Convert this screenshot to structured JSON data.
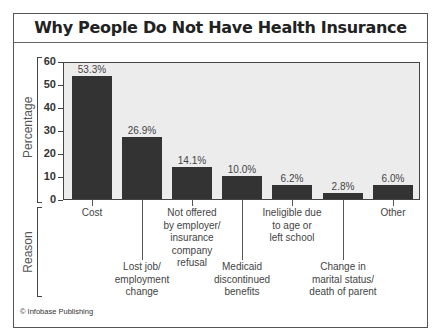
{
  "title": "Why People Do Not Have Health Insurance",
  "copyright": "© Infobase Publishing",
  "y_axis_label": "Percentage",
  "x_axis_label": "Reason",
  "colors": {
    "bar": "#333333",
    "plot_bg": "#ececec",
    "frame": "#555555"
  },
  "chart_data": {
    "type": "bar",
    "title": "Why People Do Not Have Health Insurance",
    "xlabel": "Reason",
    "ylabel": "Percentage",
    "ylim": [
      0,
      60
    ],
    "yticks": [
      0,
      10,
      20,
      30,
      40,
      50,
      60
    ],
    "grid": false,
    "legend": null,
    "categories": [
      "Cost",
      "Lost job/ employment change",
      "Not offered by employer/ insurance company refusal",
      "Medicaid discontinued benefits",
      "Ineligible due to age or left school",
      "Change in marital status/ death of parent",
      "Other"
    ],
    "values": [
      53.3,
      26.9,
      14.1,
      10.0,
      6.2,
      2.8,
      6.0
    ],
    "value_labels": [
      "53.3%",
      "26.9%",
      "14.1%",
      "10.0%",
      "6.2%",
      "2.8%",
      "6.0%"
    ]
  },
  "bars": [
    {
      "label": "Cost",
      "display": "Cost",
      "value": 53.3,
      "value_label": "53.3%",
      "label_row": "top"
    },
    {
      "label": "Lost job/ employment change",
      "display": "Lost job/\nemployment\nchange",
      "value": 26.9,
      "value_label": "26.9%",
      "label_row": "bottom"
    },
    {
      "label": "Not offered by employer/ insurance company refusal",
      "display": "Not offered\nby employer/\ninsurance\ncompany\nrefusal",
      "value": 14.1,
      "value_label": "14.1%",
      "label_row": "top"
    },
    {
      "label": "Medicaid discontinued benefits",
      "display": "Medicaid\ndiscontinued\nbenefits",
      "value": 10.0,
      "value_label": "10.0%",
      "label_row": "bottom"
    },
    {
      "label": "Ineligible due to age or left school",
      "display": "Ineligible due\nto age or\nleft school",
      "value": 6.2,
      "value_label": "6.2%",
      "label_row": "top"
    },
    {
      "label": "Change in marital status/ death of parent",
      "display": "Change in\nmarital status/\ndeath of parent",
      "value": 2.8,
      "value_label": "2.8%",
      "label_row": "bottom"
    },
    {
      "label": "Other",
      "display": "Other",
      "value": 6.0,
      "value_label": "6.0%",
      "label_row": "top"
    }
  ],
  "yticks": [
    "0",
    "10",
    "20",
    "30",
    "40",
    "50",
    "60"
  ]
}
